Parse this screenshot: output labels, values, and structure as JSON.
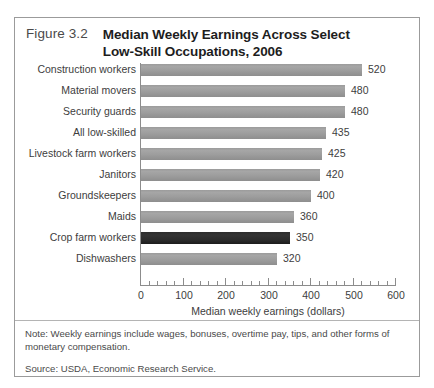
{
  "figure": {
    "number": "Figure 3.2",
    "title_line_1": "Median Weekly Earnings Across Select",
    "title_line_2": "Low-Skill Occupations, 2006",
    "note": "Note: Weekly earnings include wages, bonuses, overtime pay, tips, and other forms of monetary compensation.",
    "source": "Source: USDA, Economic Research Service."
  },
  "colors": {
    "bar": "#9e9e9e",
    "bar_highlight": "#2a2a2a",
    "axis": "#8c8c8c",
    "border": "#9b9b9b",
    "text": "#3d3d3d"
  },
  "chart_data": {
    "type": "bar",
    "orientation": "horizontal",
    "title": "Median Weekly Earnings Across Select Low-Skill Occupations, 2006",
    "xlabel": "Median weekly earnings (dollars)",
    "ylabel": "",
    "xlim": [
      0,
      600
    ],
    "xticks": [
      0,
      100,
      200,
      300,
      400,
      500,
      600
    ],
    "xtick_labels": [
      "0",
      "100",
      "200",
      "300",
      "400",
      "500",
      "600"
    ],
    "minor_tick_step": 20,
    "grid": false,
    "legend": false,
    "highlight_category": "Crop farm workers",
    "categories": [
      "Construction workers",
      "Material movers",
      "Security guards",
      "All low-skilled",
      "Livestock farm workers",
      "Janitors",
      "Groundskeepers",
      "Maids",
      "Crop farm workers",
      "Dishwashers"
    ],
    "values": [
      520,
      480,
      480,
      435,
      425,
      420,
      400,
      360,
      350,
      320
    ],
    "value_labels": [
      "520",
      "480",
      "480",
      "435",
      "425",
      "420",
      "400",
      "360",
      "350",
      "320"
    ]
  }
}
